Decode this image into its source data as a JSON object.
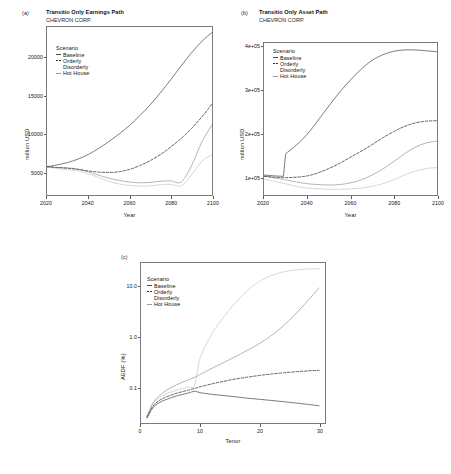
{
  "figure": {
    "company": "CHEVRON CORP.",
    "colors": {
      "baseline": "#4d4d4d",
      "orderly": "#2e2e2e",
      "disorderly": "#c9c9c9",
      "hothouse": "#9a9a9a",
      "axis": "#7a7a7a",
      "text": "#111111"
    }
  },
  "legend": {
    "title": "Scenario",
    "items": [
      {
        "label": "Baseline",
        "color": "#4d4d4d",
        "dash": "solid"
      },
      {
        "label": "Orderly",
        "color": "#2e2e2e",
        "dash": "dashed"
      },
      {
        "label": "Disorderly",
        "color": "#c9c9c9",
        "dash": "solid"
      },
      {
        "label": "Hot House",
        "color": "#9a9a9a",
        "dash": "solid"
      }
    ]
  },
  "panels": {
    "a": {
      "tag": "(a)",
      "title": "Transitio Only Earnings Path",
      "subtitle": "CHEVRON CORP."
    },
    "b": {
      "tag": "(b)",
      "title": "Transitio Only Asset Path",
      "subtitle": "CHEVRON CORP."
    },
    "c": {
      "tag": "(c)",
      "title": "",
      "subtitle": ""
    }
  },
  "chart_data": [
    {
      "panel": "a",
      "type": "line",
      "title": "Transitio Only Earnings Path",
      "subtitle": "CHEVRON CORP.",
      "xlabel": "Year",
      "ylabel": "million USD",
      "xlim": [
        2020,
        2100
      ],
      "ylim": [
        2000,
        24000
      ],
      "xticks": [
        2020,
        2040,
        2060,
        2080,
        2100
      ],
      "yticks": [
        5000,
        10000,
        15000,
        20000
      ],
      "ytick_labels": [
        "5000",
        "10000",
        "15000",
        "20000"
      ],
      "grid": false,
      "legend_position": "top-left",
      "x": [
        2020,
        2025,
        2030,
        2035,
        2040,
        2045,
        2050,
        2055,
        2060,
        2065,
        2070,
        2075,
        2080,
        2085,
        2090,
        2095,
        2100
      ],
      "series": [
        {
          "name": "Baseline",
          "dash": "solid",
          "color": "#4d4d4d",
          "values": [
            5700,
            5950,
            6250,
            6700,
            7300,
            8100,
            9000,
            10000,
            11100,
            12400,
            13800,
            15400,
            17100,
            18900,
            20600,
            22100,
            23300
          ]
        },
        {
          "name": "Orderly",
          "dash": "dashed",
          "color": "#2e2e2e",
          "values": [
            5700,
            5600,
            5500,
            5350,
            5150,
            5000,
            4950,
            5050,
            5350,
            5850,
            6500,
            7300,
            8300,
            9400,
            10700,
            12200,
            13900
          ]
        },
        {
          "name": "Disorderly",
          "dash": "solid",
          "color": "#c9c9c9",
          "values": [
            5700,
            5450,
            5300,
            5150,
            4800,
            4300,
            3800,
            3450,
            3250,
            3150,
            3200,
            3350,
            3400,
            3200,
            4600,
            6400,
            7300
          ]
        },
        {
          "name": "Hot House",
          "dash": "solid",
          "color": "#9a9a9a",
          "values": [
            5700,
            5600,
            5550,
            5400,
            5050,
            4600,
            4200,
            3900,
            3700,
            3600,
            3650,
            3800,
            3850,
            3700,
            5800,
            8900,
            11200
          ]
        }
      ]
    },
    {
      "panel": "b",
      "type": "line",
      "title": "Transitio Only Asset Path",
      "subtitle": "CHEVRON CORP.",
      "xlabel": "Year",
      "ylabel": "million USD",
      "xlim": [
        2020,
        2100
      ],
      "ylim": [
        60000,
        410000
      ],
      "xticks": [
        2020,
        2040,
        2060,
        2080,
        2100
      ],
      "yticks": [
        100000,
        200000,
        300000,
        400000
      ],
      "ytick_labels": [
        "1e+05",
        "2e+05",
        "3e+05",
        "4e+05"
      ],
      "grid": false,
      "legend_position": "top-left",
      "x": [
        2020,
        2025,
        2029,
        2030,
        2035,
        2040,
        2045,
        2050,
        2055,
        2060,
        2065,
        2070,
        2075,
        2080,
        2085,
        2090,
        2095,
        2100
      ],
      "series": [
        {
          "name": "Baseline",
          "dash": "solid",
          "color": "#4d4d4d",
          "values": [
            106000,
            104000,
            103000,
            155000,
            175000,
            200000,
            232000,
            265000,
            297000,
            325000,
            350000,
            370000,
            383000,
            391000,
            394000,
            394000,
            392000,
            390000
          ]
        },
        {
          "name": "Orderly",
          "dash": "dashed",
          "color": "#2e2e2e",
          "values": [
            103000,
            101000,
            100000,
            100000,
            101000,
            104000,
            111000,
            121000,
            133000,
            147000,
            161000,
            176000,
            192000,
            206000,
            218000,
            226000,
            230000,
            231000
          ]
        },
        {
          "name": "Disorderly",
          "dash": "solid",
          "color": "#c9c9c9",
          "values": [
            97000,
            91000,
            87000,
            86000,
            80000,
            76000,
            74000,
            73000,
            73000,
            74000,
            76000,
            80000,
            86000,
            95000,
            106000,
            115000,
            121000,
            123000
          ]
        },
        {
          "name": "Hot House",
          "dash": "solid",
          "color": "#9a9a9a",
          "values": [
            104000,
            99000,
            96000,
            95000,
            90000,
            86000,
            84000,
            83000,
            84000,
            88000,
            95000,
            106000,
            120000,
            137000,
            155000,
            170000,
            180000,
            184000
          ]
        }
      ]
    },
    {
      "panel": "c",
      "type": "line",
      "title": "",
      "subtitle": "",
      "xlabel": "Tenor",
      "ylabel": "AEDF (%)",
      "yscale": "log",
      "xlim": [
        0,
        31
      ],
      "ylim": [
        0.02,
        30
      ],
      "xticks": [
        0,
        10,
        20,
        30
      ],
      "yticks": [
        0.1,
        1.0,
        10.0
      ],
      "ytick_labels": [
        "0.1",
        "1.0",
        "10.0"
      ],
      "grid": false,
      "legend_position": "top-left",
      "x": [
        1,
        2,
        3,
        4,
        5,
        6,
        7,
        8,
        9,
        10,
        12,
        14,
        16,
        18,
        20,
        22,
        24,
        26,
        28,
        30
      ],
      "series": [
        {
          "name": "Baseline",
          "dash": "solid",
          "color": "#4d4d4d",
          "values": [
            0.025,
            0.04,
            0.05,
            0.057,
            0.063,
            0.069,
            0.074,
            0.079,
            0.085,
            0.08,
            0.074,
            0.07,
            0.066,
            0.062,
            0.059,
            0.056,
            0.053,
            0.05,
            0.047,
            0.044
          ]
        },
        {
          "name": "Orderly",
          "dash": "dashed",
          "color": "#2e2e2e",
          "values": [
            0.026,
            0.043,
            0.055,
            0.064,
            0.071,
            0.078,
            0.084,
            0.09,
            0.097,
            0.105,
            0.12,
            0.135,
            0.15,
            0.163,
            0.176,
            0.188,
            0.198,
            0.208,
            0.216,
            0.222
          ]
        },
        {
          "name": "Disorderly",
          "dash": "solid",
          "color": "#c9c9c9",
          "values": [
            0.027,
            0.048,
            0.062,
            0.073,
            0.082,
            0.09,
            0.097,
            0.104,
            0.11,
            0.4,
            1.2,
            2.6,
            5.0,
            8.6,
            13.0,
            17.0,
            20.0,
            21.8,
            22.8,
            23.2
          ]
        },
        {
          "name": "Hot House",
          "dash": "solid",
          "color": "#9a9a9a",
          "values": [
            0.027,
            0.05,
            0.068,
            0.085,
            0.1,
            0.115,
            0.13,
            0.145,
            0.16,
            0.185,
            0.245,
            0.32,
            0.42,
            0.56,
            0.76,
            1.1,
            1.7,
            2.9,
            5.2,
            9.6
          ]
        }
      ]
    }
  ]
}
